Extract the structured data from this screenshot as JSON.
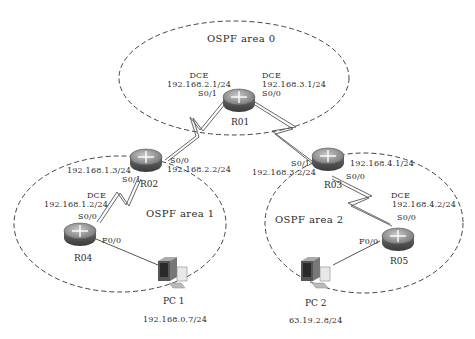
{
  "areas": [
    {
      "id": "area0",
      "label": "OSPF area 0"
    },
    {
      "id": "area1",
      "label": "OSPF area 1"
    },
    {
      "id": "area2",
      "label": "OSPF area 2"
    }
  ],
  "devices": {
    "r01": {
      "name": "R01"
    },
    "r02": {
      "name": "R02"
    },
    "r03": {
      "name": "R03"
    },
    "r04": {
      "name": "R04"
    },
    "r05": {
      "name": "R05"
    },
    "pc1": {
      "name": "PC 1",
      "ip": "192.168.0.7/24"
    },
    "pc2": {
      "name": "PC 2",
      "ip": "63.19.2.8/24"
    }
  },
  "interfaces": {
    "r01_s01": {
      "dce": "DCE",
      "ip": "192.168.2.1/24",
      "port": "S0/1"
    },
    "r01_s00": {
      "dce": "DCE",
      "ip": "192.168.3.1/24",
      "port": "S0/0"
    },
    "r02_s00": {
      "port": "S0/0",
      "ip": "192.168.2.2/24"
    },
    "r02_s01": {
      "port": "S0/1",
      "ip": "192.168.1.3/24"
    },
    "r04_s00": {
      "dce": "DCE",
      "ip": "192.168.1.2/24",
      "port": "S0/0"
    },
    "r04_f00": {
      "port": "F0/0"
    },
    "r03_s01": {
      "port": "S0/1",
      "ip": "192.168.3.2/24"
    },
    "r03_s00": {
      "ip": "192.168.4.1/24",
      "port": "S0/0"
    },
    "r05_s00": {
      "dce": "DCE",
      "ip": "192.168.4.2/24",
      "port": "S0/0"
    },
    "r05_f00": {
      "port": "F0/0"
    }
  },
  "colors": {
    "line": "#555555",
    "dash": "#444444",
    "router_top": "#9a9a9a",
    "router_side": "#5a5a5a"
  }
}
